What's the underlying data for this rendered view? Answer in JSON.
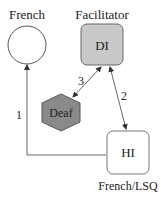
{
  "diagram": {
    "nodes": {
      "french": {
        "label": "French",
        "shape": "circle",
        "fill": "#ffffff",
        "inner": ""
      },
      "facilitator": {
        "label": "Facilitator",
        "shape": "rounded-square",
        "fill": "#c8c8c8",
        "inner": "DI"
      },
      "deaf": {
        "label": "",
        "shape": "hexagon",
        "fill": "#8a8a8a",
        "inner": "Deaf"
      },
      "hi": {
        "label": "French/LSQ",
        "shape": "rounded-square",
        "fill": "#ffffff",
        "inner": "HI"
      }
    },
    "edges": [
      {
        "id": "1",
        "label": "1",
        "from": "hi",
        "to": "french",
        "direction": "to-french"
      },
      {
        "id": "2",
        "label": "2",
        "from": "facilitator",
        "to": "hi",
        "direction": "bidirectional"
      },
      {
        "id": "3",
        "label": "3",
        "from": "facilitator",
        "to": "deaf",
        "direction": "bidirectional"
      }
    ]
  }
}
